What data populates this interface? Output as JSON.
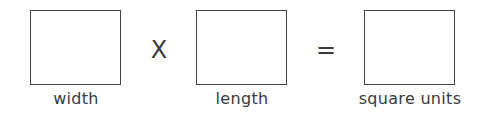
{
  "equation": {
    "terms": [
      {
        "label": "width"
      },
      {
        "label": "length"
      },
      {
        "label": "square units"
      }
    ],
    "operators": {
      "multiply": "X",
      "equals": "="
    }
  }
}
